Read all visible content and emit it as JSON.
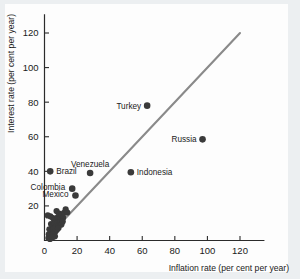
{
  "figure": {
    "background_color": "#fdfdfd",
    "dot_color": "#3a3a3a",
    "line_color": "#8a8a8a",
    "axis_color": "#2b2b2b"
  },
  "chart_data": {
    "type": "scatter",
    "title": "",
    "xlabel": "Inflation rate (per cent per year)",
    "ylabel": "Interest rate (per cent per year)",
    "xlim": [
      0,
      135
    ],
    "ylim": [
      0,
      128
    ],
    "xticks": [
      0,
      20,
      40,
      60,
      80,
      100,
      120
    ],
    "xtick_labels": [
      "0",
      "20",
      "40",
      "60",
      "80",
      "100",
      "120"
    ],
    "yticks": [
      20,
      40,
      60,
      80,
      100,
      120
    ],
    "ytick_labels": [
      "20",
      "40",
      "60",
      "80",
      "100",
      "120"
    ],
    "grid": false,
    "legend": false,
    "reference_line": {
      "name": "45-degree line",
      "x": [
        2,
        120
      ],
      "y": [
        2,
        120
      ]
    },
    "labeled_points": [
      {
        "label": "Turkey",
        "x": 63,
        "y": 78,
        "label_side": "left"
      },
      {
        "label": "Russia",
        "x": 97,
        "y": 58.5,
        "label_side": "left"
      },
      {
        "label": "Indonesia",
        "x": 53,
        "y": 39.5,
        "label_side": "right"
      },
      {
        "label": "Venezuela",
        "x": 28,
        "y": 39,
        "label_side": "above"
      },
      {
        "label": "Brazil",
        "x": 3.5,
        "y": 40,
        "label_side": "right"
      },
      {
        "label": "Colombia",
        "x": 17,
        "y": 30,
        "label_side": "left-offset"
      },
      {
        "label": "Mexico",
        "x": 19,
        "y": 26,
        "label_side": "left-offset"
      }
    ],
    "unlabeled_points": [
      {
        "x": 2.0,
        "y": 14.5
      },
      {
        "x": 3.6,
        "y": 14.0
      },
      {
        "x": 5.2,
        "y": 13.0
      },
      {
        "x": 6.0,
        "y": 12.0
      },
      {
        "x": 7.4,
        "y": 17.0
      },
      {
        "x": 8.2,
        "y": 13.6
      },
      {
        "x": 9.0,
        "y": 15.5
      },
      {
        "x": 9.8,
        "y": 12.6
      },
      {
        "x": 10.6,
        "y": 14.8
      },
      {
        "x": 11.4,
        "y": 13.2
      },
      {
        "x": 12.0,
        "y": 16.0
      },
      {
        "x": 4.0,
        "y": 9.5
      },
      {
        "x": 5.0,
        "y": 8.4
      },
      {
        "x": 6.2,
        "y": 9.8
      },
      {
        "x": 7.0,
        "y": 8.0
      },
      {
        "x": 8.0,
        "y": 10.2
      },
      {
        "x": 8.8,
        "y": 8.8
      },
      {
        "x": 9.6,
        "y": 10.6
      },
      {
        "x": 10.4,
        "y": 9.2
      },
      {
        "x": 11.2,
        "y": 11.0
      },
      {
        "x": 3.0,
        "y": 6.5
      },
      {
        "x": 4.4,
        "y": 5.6
      },
      {
        "x": 5.6,
        "y": 6.8
      },
      {
        "x": 6.6,
        "y": 5.0
      },
      {
        "x": 7.6,
        "y": 6.2
      },
      {
        "x": 8.6,
        "y": 7.2
      },
      {
        "x": 2.6,
        "y": 3.6
      },
      {
        "x": 3.8,
        "y": 2.8
      },
      {
        "x": 5.0,
        "y": 3.4
      },
      {
        "x": 6.4,
        "y": 2.4
      },
      {
        "x": 2.4,
        "y": 1.4
      },
      {
        "x": 3.4,
        "y": 0.9
      },
      {
        "x": 4.8,
        "y": 1.8
      },
      {
        "x": 13.0,
        "y": 18.0
      },
      {
        "x": 14.0,
        "y": 16.2
      }
    ]
  }
}
